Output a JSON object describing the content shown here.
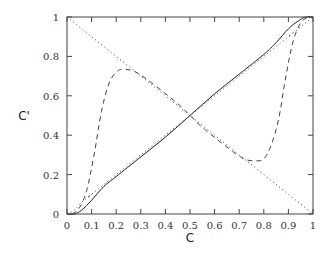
{
  "chart_data": {
    "type": "line",
    "title": "",
    "xlabel": "C",
    "ylabel": "C'",
    "xlim": [
      0,
      1
    ],
    "ylim": [
      0,
      1
    ],
    "grid": false,
    "legend": null,
    "xticks": [
      "0",
      "0.1",
      "0.2",
      "0.3",
      "0.4",
      "0.5",
      "0.6",
      "0.7",
      "0.8",
      "0.9",
      "1"
    ],
    "yticks": [
      "0",
      "0.2",
      "0.4",
      "0.6",
      "0.8",
      "1"
    ],
    "series": [
      {
        "name": "solid",
        "style": "solid",
        "x": [
          0,
          0.03,
          0.06,
          0.1,
          0.15,
          0.2,
          0.3,
          0.4,
          0.5,
          0.6,
          0.7,
          0.8,
          0.85,
          0.9,
          0.94,
          0.97,
          1.0
        ],
        "y": [
          0,
          0.0,
          0.02,
          0.07,
          0.14,
          0.19,
          0.29,
          0.39,
          0.5,
          0.61,
          0.71,
          0.81,
          0.87,
          0.94,
          0.98,
          1.0,
          1.0
        ]
      },
      {
        "name": "dotted-near-solid",
        "style": "dotted",
        "x": [
          0,
          0.03,
          0.06,
          0.1,
          0.15,
          0.85,
          0.9,
          0.94,
          0.97,
          1.0
        ],
        "y": [
          0,
          0.02,
          0.06,
          0.1,
          0.15,
          0.85,
          0.9,
          0.94,
          0.97,
          1.0
        ]
      },
      {
        "name": "dashed",
        "style": "dashed",
        "x": [
          0.02,
          0.05,
          0.08,
          0.11,
          0.14,
          0.17,
          0.2,
          0.23,
          0.28,
          0.35,
          0.45,
          0.5,
          0.55,
          0.65,
          0.72,
          0.77,
          0.8,
          0.83,
          0.86,
          0.89,
          0.92,
          0.95,
          0.98
        ],
        "y": [
          0,
          0.03,
          0.12,
          0.3,
          0.52,
          0.66,
          0.72,
          0.735,
          0.72,
          0.66,
          0.56,
          0.5,
          0.44,
          0.34,
          0.28,
          0.27,
          0.28,
          0.35,
          0.48,
          0.7,
          0.88,
          0.97,
          1.0
        ]
      },
      {
        "name": "dotted-diagonal",
        "style": "dotted",
        "x": [
          0,
          1
        ],
        "y": [
          1,
          0
        ]
      }
    ]
  }
}
